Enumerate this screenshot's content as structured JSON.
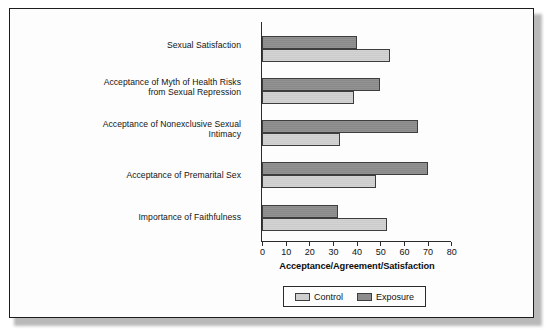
{
  "chart_data": {
    "type": "bar",
    "orientation": "horizontal",
    "title": "",
    "xlabel": "Acceptance/Agreement/Satisfaction",
    "ylabel": "",
    "xlim": [
      0,
      80
    ],
    "xticks": [
      0,
      10,
      20,
      30,
      40,
      50,
      60,
      70,
      80
    ],
    "grid": false,
    "legend_position": "bottom",
    "categories": [
      "Sexual Satisfaction",
      "Acceptance of Myth of Health Risks from Sexual Repression",
      "Acceptance of Nonexclusive Sexual Intimacy",
      "Acceptance of Premarital Sex",
      "Importance of Faithfulness"
    ],
    "category_lines": [
      [
        "Sexual Satisfaction"
      ],
      [
        "Acceptance of Myth of Health Risks",
        "from Sexual Repression"
      ],
      [
        "Acceptance of Nonexclusive Sexual",
        "Intimacy"
      ],
      [
        "Acceptance of Premarital Sex"
      ],
      [
        "Importance of Faithfulness"
      ]
    ],
    "series": [
      {
        "name": "Exposure",
        "color": "#8c8c8c",
        "values": [
          40,
          50,
          66,
          70,
          32
        ]
      },
      {
        "name": "Control",
        "color": "#cfcfcf",
        "values": [
          54,
          39,
          33,
          48,
          53
        ]
      }
    ]
  },
  "legend": {
    "items": [
      {
        "label": "Control",
        "swatch": "control"
      },
      {
        "label": "Exposure",
        "swatch": "exposure"
      }
    ]
  },
  "axis": {
    "x_title": "Acceptance/Agreement/Satisfaction",
    "tick_labels": [
      "0",
      "10",
      "20",
      "30",
      "40",
      "50",
      "60",
      "70",
      "80"
    ]
  },
  "colors": {
    "exposure": "#8c8c8c",
    "control": "#cfcfcf",
    "frame": "#1c1c1c",
    "axis": "#2b2b2b",
    "text": "#141414",
    "background": "#fdfdfd"
  }
}
